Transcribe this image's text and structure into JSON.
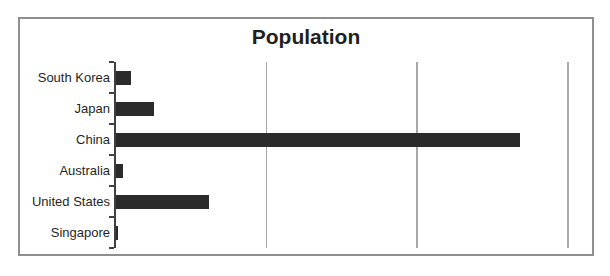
{
  "chart_data": {
    "type": "bar",
    "orientation": "horizontal",
    "title": "Population",
    "categories": [
      "South Korea",
      "Japan",
      "China",
      "Australia",
      "United States",
      "Singapore"
    ],
    "values": [
      49000000,
      127000000,
      1340000000,
      22000000,
      310000000,
      5000000
    ],
    "xlabel": "",
    "ylabel": "",
    "xlim": [
      0,
      1500000000
    ],
    "gridlines": [
      500000000,
      1000000000,
      1500000000
    ],
    "gridline_interval": 500000000,
    "axis_tick_labels_visible": false,
    "legend": "none",
    "bar_color": "#2b2b2b",
    "gridline_color": "#a8a8a8",
    "axis_color": "#404040",
    "frame_border_color": "#8f8f8f",
    "text_color": "#1f1f1f"
  }
}
